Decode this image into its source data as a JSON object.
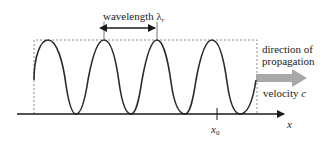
{
  "diagram": {
    "type": "travelling-wave",
    "wavelength_label": "wavelength",
    "wavelength_symbol": "λ",
    "wavelength_subscript": "r",
    "direction_label_line1": "direction of",
    "direction_label_line2": "propagation",
    "velocity_label": "velocity",
    "velocity_symbol": "c",
    "axis_label": "x",
    "marker_label": "x",
    "marker_subscript": "0",
    "colors": {
      "wave": "#2a2a2a",
      "axis": "#1a1a1a",
      "dashed_box": "#8a8a8a",
      "propagation_arrow": "#a8a8a8",
      "text": "#222222"
    }
  }
}
